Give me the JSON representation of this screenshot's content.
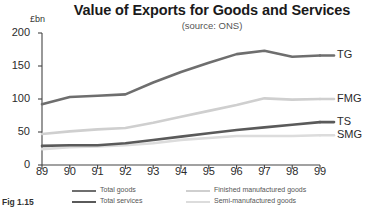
{
  "chart_data": {
    "type": "line",
    "title": "Value of Exports for Goods and Services",
    "subtitle": "(source: ONS)",
    "xlabel": "",
    "ylabel": "£bn",
    "yunit": "£bn",
    "xlim": [
      89,
      99
    ],
    "ylim": [
      0,
      200
    ],
    "grid": false,
    "legend_position": "bottom",
    "categories": [
      "89",
      "90",
      "91",
      "92",
      "93",
      "94",
      "95",
      "96",
      "97",
      "98",
      "99"
    ],
    "yticks": [
      "0",
      "50",
      "100",
      "150",
      "200"
    ],
    "series": [
      {
        "name": "Total goods",
        "short": "TG",
        "color": "#6e6e6e",
        "values": [
          92,
          103,
          105,
          107,
          125,
          141,
          155,
          168,
          173,
          164,
          166
        ]
      },
      {
        "name": "Finished manufactured goods",
        "short": "FMG",
        "color": "#cfcfcf",
        "values": [
          47,
          51,
          54,
          56,
          64,
          73,
          82,
          91,
          101,
          99,
          100
        ]
      },
      {
        "name": "Total services",
        "short": "TS",
        "color": "#5a5a5a",
        "values": [
          29,
          30,
          30,
          33,
          38,
          43,
          48,
          53,
          57,
          61,
          65
        ]
      },
      {
        "name": "Semi-manufactured goods",
        "short": "SMG",
        "color": "#dcdcdc",
        "values": [
          24,
          27,
          28,
          30,
          33,
          38,
          41,
          44,
          44,
          44,
          45
        ]
      }
    ],
    "annotations": []
  },
  "legend": {
    "entries": [
      {
        "label": "Total goods",
        "color": "#6e6e6e"
      },
      {
        "label": "Total services",
        "color": "#5a5a5a"
      },
      {
        "label": "Finished manufactured goods",
        "color": "#cfcfcf"
      },
      {
        "label": "Semi-manufactured goods",
        "color": "#dcdcdc"
      }
    ]
  },
  "caption": "Fig 1.15"
}
